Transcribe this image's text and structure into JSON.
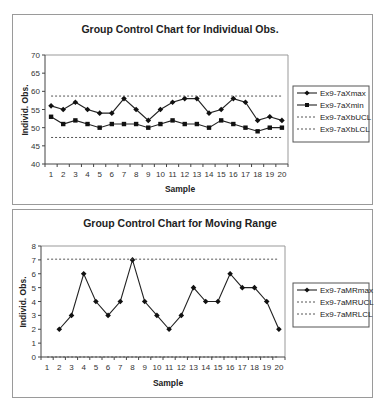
{
  "chart_data": [
    {
      "type": "line",
      "title": "Group Control Chart for Individual Obs.",
      "xlabel": "Sample",
      "ylabel": "Individ. Obs.",
      "x": [
        1,
        2,
        3,
        4,
        5,
        6,
        7,
        8,
        9,
        10,
        11,
        12,
        13,
        14,
        15,
        16,
        17,
        18,
        19,
        20
      ],
      "ylim": [
        40,
        70
      ],
      "yticks": [
        40,
        45,
        50,
        55,
        60,
        65,
        70
      ],
      "legend_position": "right",
      "grid": false,
      "series": [
        {
          "name": "Ex9-7aXmax",
          "marker": "diamond",
          "style": "solid",
          "values": [
            56,
            55,
            57,
            55,
            54,
            54,
            58,
            55,
            52,
            55,
            57,
            58,
            58,
            54,
            55,
            58,
            57,
            52,
            53,
            52
          ]
        },
        {
          "name": "Ex9-7aXmin",
          "marker": "square",
          "style": "solid",
          "values": [
            53,
            51,
            52,
            51,
            50,
            51,
            51,
            51,
            50,
            51,
            52,
            51,
            51,
            50,
            52,
            51,
            50,
            49,
            50,
            50
          ]
        },
        {
          "name": "Ex9-7aXbUCL",
          "marker": "none",
          "style": "dotted",
          "constant": 58.7
        },
        {
          "name": "Ex9-7aXbLCL",
          "marker": "none",
          "style": "dotted",
          "constant": 47.3
        }
      ]
    },
    {
      "type": "line",
      "title": "Group Control Chart for Moving Range",
      "xlabel": "Sample",
      "ylabel": "Individ. Obs.",
      "x": [
        1,
        2,
        3,
        4,
        5,
        6,
        7,
        8,
        9,
        10,
        11,
        12,
        13,
        14,
        15,
        16,
        17,
        18,
        19,
        20
      ],
      "ylim": [
        0,
        8
      ],
      "yticks": [
        0,
        1,
        2,
        3,
        4,
        5,
        6,
        7,
        8
      ],
      "legend_position": "right",
      "grid": false,
      "series": [
        {
          "name": "Ex9-7aMRmax",
          "marker": "diamond",
          "style": "solid",
          "values": [
            null,
            2,
            3,
            6,
            4,
            3,
            4,
            7,
            4,
            3,
            2,
            3,
            5,
            4,
            4,
            6,
            5,
            5,
            4,
            2
          ]
        },
        {
          "name": "Ex9-7aMRUCL",
          "marker": "none",
          "style": "dotted",
          "constant": 7.05
        },
        {
          "name": "Ex9-7aMRLCL",
          "marker": "none",
          "style": "dotted",
          "constant": 0
        }
      ]
    }
  ]
}
